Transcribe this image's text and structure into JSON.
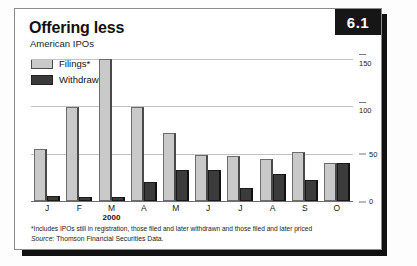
{
  "badge": {
    "label": "6.1"
  },
  "header": {
    "title": "Offering less",
    "subtitle": "American IPOs"
  },
  "legend": {
    "items": [
      {
        "label": "Filings*",
        "color": "#c9c9c9",
        "name": "filings"
      },
      {
        "label": "Withdrawals",
        "color": "#3b3b3b",
        "name": "withdrawals"
      }
    ]
  },
  "axis": {
    "year_label": "2000",
    "yticks": [
      "150",
      "100",
      "50",
      "0"
    ]
  },
  "notes": {
    "footnote": "*Includes IPOs still in registration, those filed and later withdrawn and those filed and later priced",
    "source_prefix": "Source:",
    "source_text": "Thomson Financial Securities Data."
  },
  "chart_data": {
    "type": "bar",
    "title": "Offering less",
    "subtitle": "American IPOs",
    "xlabel": "2000",
    "ylabel": "",
    "ylim": [
      0,
      160
    ],
    "yticks": [
      0,
      50,
      100,
      150
    ],
    "grid": true,
    "legend_position": "top-left",
    "categories": [
      "J",
      "F",
      "M",
      "A",
      "M",
      "J",
      "J",
      "A",
      "S",
      "O"
    ],
    "series": [
      {
        "name": "Filings*",
        "color": "#c9c9c9",
        "values": [
          55,
          99,
          150,
          99,
          72,
          48,
          47,
          44,
          52,
          40
        ]
      },
      {
        "name": "Withdrawals",
        "color": "#3b3b3b",
        "values": [
          5,
          4,
          4,
          20,
          33,
          33,
          14,
          28,
          22,
          40
        ]
      }
    ],
    "annotations": [
      "*Includes IPOs still in registration, those filed and later withdrawn and those filed and later priced",
      "Source: Thomson Financial Securities Data."
    ]
  }
}
